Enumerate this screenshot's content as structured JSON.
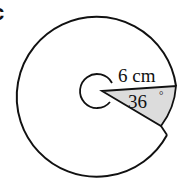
{
  "figure": {
    "part_label": "c",
    "radius_label": "6 cm",
    "angle_label": "36",
    "angle_unit": "°",
    "colors": {
      "stroke": "#111111",
      "shaded_sector": "#dcdcdc",
      "background": "#ffffff"
    }
  }
}
